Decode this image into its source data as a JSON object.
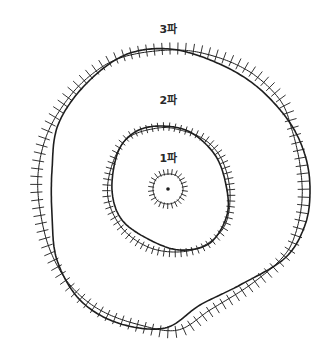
{
  "diagram": {
    "ink_color": "#1e1e1e",
    "center": [
      168,
      189
    ],
    "waves": [
      {
        "id": "wave-1",
        "label": "1파",
        "label_pos": [
          168,
          157
        ],
        "smooth": [
          [
            168,
            174
          ],
          [
            178,
            177
          ],
          [
            183,
            189
          ],
          [
            178,
            200
          ],
          [
            168,
            204
          ],
          [
            157,
            200
          ],
          [
            153,
            189
          ],
          [
            157,
            178
          ]
        ],
        "hatched": [
          [
            168,
            174
          ],
          [
            178,
            177
          ],
          [
            183,
            189
          ],
          [
            178,
            200
          ],
          [
            168,
            204
          ],
          [
            157,
            200
          ],
          [
            153,
            189
          ],
          [
            157,
            178
          ]
        ],
        "tick_len": 5,
        "tick_count": 26,
        "tick_dir": "out"
      },
      {
        "id": "wave-2",
        "label": "2파",
        "label_pos": [
          168,
          99
        ],
        "smooth": [
          [
            160,
            126
          ],
          [
            190,
            132
          ],
          [
            215,
            155
          ],
          [
            226,
            185
          ],
          [
            227,
            215
          ],
          [
            210,
            243
          ],
          [
            180,
            250
          ],
          [
            150,
            240
          ],
          [
            122,
            220
          ],
          [
            112,
            190
          ],
          [
            118,
            152
          ],
          [
            135,
            132
          ]
        ],
        "hatched": [
          [
            158,
            128
          ],
          [
            180,
            130
          ],
          [
            205,
            140
          ],
          [
            222,
            160
          ],
          [
            230,
            192
          ],
          [
            225,
            225
          ],
          [
            205,
            245
          ],
          [
            178,
            252
          ],
          [
            148,
            247
          ],
          [
            122,
            228
          ],
          [
            108,
            198
          ],
          [
            112,
            165
          ],
          [
            128,
            138
          ]
        ],
        "tick_len": 7,
        "tick_count": 70,
        "tick_dir": "mixed"
      },
      {
        "id": "wave-3",
        "label": "3파",
        "label_pos": [
          168,
          28
        ],
        "smooth": [
          [
            170,
            49
          ],
          [
            215,
            62
          ],
          [
            255,
            85
          ],
          [
            288,
            120
          ],
          [
            305,
            155
          ],
          [
            310,
            190
          ],
          [
            305,
            225
          ],
          [
            285,
            258
          ],
          [
            240,
            285
          ],
          [
            200,
            305
          ],
          [
            165,
            328
          ],
          [
            118,
            323
          ],
          [
            80,
            300
          ],
          [
            57,
            260
          ],
          [
            52,
            215
          ],
          [
            52,
            170
          ],
          [
            58,
            125
          ],
          [
            85,
            85
          ],
          [
            125,
            55
          ]
        ],
        "hatched": [
          [
            170,
            50
          ],
          [
            210,
            55
          ],
          [
            250,
            72
          ],
          [
            280,
            100
          ],
          [
            292,
            130
          ],
          [
            300,
            165
          ],
          [
            302,
            200
          ],
          [
            295,
            235
          ],
          [
            282,
            258
          ],
          [
            250,
            285
          ],
          [
            210,
            310
          ],
          [
            178,
            330
          ],
          [
            140,
            325
          ],
          [
            100,
            310
          ],
          [
            70,
            285
          ],
          [
            50,
            250
          ],
          [
            40,
            210
          ],
          [
            38,
            175
          ],
          [
            45,
            140
          ],
          [
            60,
            110
          ],
          [
            85,
            80
          ],
          [
            120,
            58
          ]
        ],
        "tick_len": 10,
        "tick_count": 110,
        "tick_dir": "mixed"
      }
    ],
    "epicenter_dot": {
      "pos": [
        168,
        189
      ],
      "radius": 1.8
    }
  }
}
